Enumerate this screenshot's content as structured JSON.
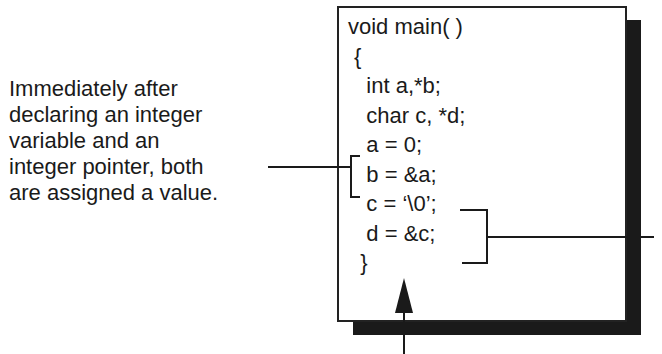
{
  "caption": {
    "lines": [
      "Immediately after",
      "declaring an integer",
      "variable and an",
      "integer pointer, both",
      "are assigned a value."
    ]
  },
  "code": {
    "lines": [
      "void main( )",
      " {",
      "   int a,*b;",
      "   char c, *d;",
      "   a = 0;",
      "   b = &a;",
      "   c = ‘\\0’;",
      "   d = &c;",
      "  }"
    ]
  },
  "colors": {
    "ink": "#1a1a1a",
    "background": "#ffffff"
  }
}
